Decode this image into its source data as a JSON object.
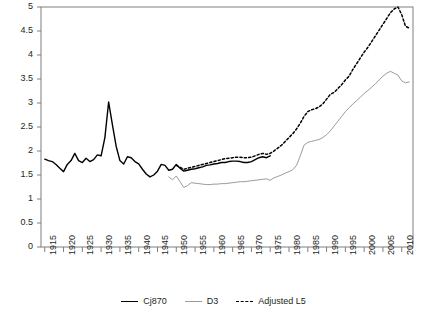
{
  "chart_data": {
    "type": "line",
    "title": "",
    "subtitle": "",
    "xlabel": "",
    "ylabel": "",
    "xlim": [
      1914,
      2013
    ],
    "ylim": [
      0,
      5
    ],
    "grid": false,
    "legend_position": "bottom-center",
    "y_ticks": [
      "0",
      "0.5",
      "1",
      "1.5",
      "2",
      "2.5",
      "3",
      "3.5",
      "4",
      "4.5",
      "5"
    ],
    "y_tick_values": [
      0,
      0.5,
      1,
      1.5,
      2,
      2.5,
      3,
      3.5,
      4,
      4.5,
      5
    ],
    "x_ticks": [
      "1915",
      "1920",
      "1925",
      "1930",
      "1935",
      "1940",
      "1945",
      "1950",
      "1955",
      "1960",
      "1965",
      "1970",
      "1975",
      "1980",
      "1985",
      "1990",
      "1995",
      "2000",
      "2005",
      "2010"
    ],
    "x_tick_values": [
      1915,
      1920,
      1925,
      1930,
      1935,
      1940,
      1945,
      1950,
      1955,
      1960,
      1965,
      1970,
      1975,
      1980,
      1985,
      1990,
      1995,
      2000,
      2005,
      2010
    ],
    "series": [
      {
        "name": "Cj870",
        "color": "#000000",
        "style": "solid",
        "x": [
          1915,
          1916,
          1917,
          1918,
          1919,
          1920,
          1921,
          1922,
          1923,
          1924,
          1925,
          1926,
          1927,
          1928,
          1929,
          1930,
          1931,
          1932,
          1933,
          1934,
          1935,
          1936,
          1937,
          1938,
          1939,
          1940,
          1941,
          1942,
          1943,
          1944,
          1945,
          1946,
          1947,
          1948,
          1949,
          1950,
          1951,
          1952,
          1953,
          1954,
          1955,
          1956,
          1957,
          1958,
          1959,
          1960,
          1961,
          1962,
          1963,
          1964,
          1965,
          1966,
          1967,
          1968,
          1969,
          1970,
          1971,
          1972,
          1973,
          1974,
          1975
        ],
        "values": [
          1.83,
          1.8,
          1.78,
          1.72,
          1.64,
          1.57,
          1.72,
          1.8,
          1.95,
          1.8,
          1.76,
          1.85,
          1.78,
          1.82,
          1.92,
          1.9,
          2.28,
          3.02,
          2.55,
          2.1,
          1.8,
          1.73,
          1.88,
          1.86,
          1.78,
          1.73,
          1.62,
          1.52,
          1.46,
          1.5,
          1.58,
          1.72,
          1.7,
          1.6,
          1.62,
          1.72,
          1.64,
          1.58,
          1.6,
          1.62,
          1.63,
          1.65,
          1.67,
          1.7,
          1.71,
          1.73,
          1.74,
          1.76,
          1.76,
          1.78,
          1.79,
          1.79,
          1.78,
          1.76,
          1.76,
          1.78,
          1.82,
          1.86,
          1.88,
          1.86,
          1.9
        ]
      },
      {
        "name": "D3",
        "color": "#9a9a9a",
        "style": "solid",
        "x": [
          1948,
          1949,
          1950,
          1951,
          1952,
          1953,
          1954,
          1955,
          1956,
          1957,
          1958,
          1959,
          1960,
          1961,
          1962,
          1963,
          1964,
          1965,
          1966,
          1967,
          1968,
          1969,
          1970,
          1971,
          1972,
          1973,
          1974,
          1975,
          1976,
          1977,
          1978,
          1979,
          1980,
          1981,
          1982,
          1983,
          1984,
          1985,
          1986,
          1987,
          1988,
          1989,
          1990,
          1991,
          1992,
          1993,
          1994,
          1995,
          1996,
          1997,
          1998,
          1999,
          2000,
          2001,
          2002,
          2003,
          2004,
          2005,
          2006,
          2007,
          2008,
          2009,
          2010,
          2011,
          2012
        ],
        "values": [
          1.46,
          1.4,
          1.48,
          1.36,
          1.24,
          1.28,
          1.34,
          1.33,
          1.32,
          1.31,
          1.3,
          1.3,
          1.31,
          1.31,
          1.32,
          1.32,
          1.33,
          1.34,
          1.35,
          1.36,
          1.36,
          1.37,
          1.38,
          1.39,
          1.4,
          1.41,
          1.42,
          1.39,
          1.44,
          1.47,
          1.5,
          1.54,
          1.57,
          1.61,
          1.7,
          1.9,
          2.12,
          2.18,
          2.2,
          2.22,
          2.24,
          2.28,
          2.34,
          2.42,
          2.52,
          2.62,
          2.72,
          2.82,
          2.9,
          2.98,
          3.05,
          3.12,
          3.2,
          3.26,
          3.33,
          3.4,
          3.48,
          3.56,
          3.62,
          3.66,
          3.62,
          3.58,
          3.46,
          3.42,
          3.44
        ]
      },
      {
        "name": "Adjusted L5",
        "color": "#000000",
        "style": "dashed",
        "x": [
          1950,
          1951,
          1952,
          1953,
          1954,
          1955,
          1956,
          1957,
          1958,
          1959,
          1960,
          1961,
          1962,
          1963,
          1964,
          1965,
          1966,
          1967,
          1968,
          1969,
          1970,
          1971,
          1972,
          1973,
          1974,
          1975,
          1976,
          1977,
          1978,
          1979,
          1980,
          1981,
          1982,
          1983,
          1984,
          1985,
          1986,
          1987,
          1988,
          1989,
          1990,
          1991,
          1992,
          1993,
          1994,
          1995,
          1996,
          1997,
          1998,
          1999,
          2000,
          2001,
          2002,
          2003,
          2004,
          2005,
          2006,
          2007,
          2008,
          2009,
          2010,
          2011,
          2012
        ],
        "values": [
          1.7,
          1.66,
          1.62,
          1.64,
          1.66,
          1.68,
          1.7,
          1.72,
          1.74,
          1.76,
          1.78,
          1.8,
          1.82,
          1.84,
          1.85,
          1.86,
          1.87,
          1.87,
          1.86,
          1.86,
          1.87,
          1.9,
          1.93,
          1.95,
          1.93,
          1.95,
          2.0,
          2.06,
          2.12,
          2.2,
          2.28,
          2.36,
          2.46,
          2.58,
          2.72,
          2.82,
          2.86,
          2.88,
          2.92,
          2.98,
          3.08,
          3.18,
          3.22,
          3.3,
          3.38,
          3.48,
          3.56,
          3.7,
          3.82,
          3.94,
          4.06,
          4.16,
          4.28,
          4.4,
          4.52,
          4.64,
          4.76,
          4.88,
          4.96,
          5.0,
          4.84,
          4.6,
          4.56
        ]
      }
    ]
  },
  "legend": {
    "items": [
      {
        "label": "Cj870",
        "style": "solid-black"
      },
      {
        "label": "D3",
        "style": "solid-gray"
      },
      {
        "label": "Adjusted L5",
        "style": "dashed-black"
      }
    ]
  }
}
